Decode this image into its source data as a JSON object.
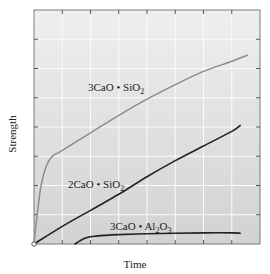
{
  "chart_data": {
    "type": "line",
    "title": "",
    "xlabel": "Time",
    "ylabel": "Strength",
    "x_ticks_labeled": false,
    "y_ticks_labeled": false,
    "grid": true,
    "grid_divisions": {
      "x": 8,
      "y": 8
    },
    "xlim": [
      0,
      8
    ],
    "ylim": [
      0,
      8
    ],
    "legend": "inline labels on curves",
    "series": [
      {
        "name": "3CaO • SiO2",
        "label_display": "3CaO • SiO₂",
        "color": "#8c8c8c",
        "points": [
          [
            0,
            0
          ],
          [
            0.1,
            0.9
          ],
          [
            0.25,
            2.0
          ],
          [
            0.45,
            2.7
          ],
          [
            0.65,
            3.0
          ],
          [
            1.0,
            3.2
          ],
          [
            2,
            3.8
          ],
          [
            3,
            4.4
          ],
          [
            4,
            4.95
          ],
          [
            5,
            5.45
          ],
          [
            6,
            5.9
          ],
          [
            7,
            6.25
          ],
          [
            7.55,
            6.45
          ]
        ]
      },
      {
        "name": "2CaO • SiO2",
        "label_display": "2CaO • SiO₂",
        "color": "#222222",
        "points": [
          [
            0,
            0
          ],
          [
            1,
            0.6
          ],
          [
            2,
            1.15
          ],
          [
            3,
            1.7
          ],
          [
            4,
            2.3
          ],
          [
            5,
            2.85
          ],
          [
            6,
            3.35
          ],
          [
            7,
            3.85
          ],
          [
            7.3,
            4.05
          ]
        ]
      },
      {
        "name": "3CaO • Al2O3",
        "label_display": "3CaO • Al₂O₃",
        "color": "#222222",
        "points": [
          [
            1.45,
            0
          ],
          [
            1.8,
            0.2
          ],
          [
            2.2,
            0.27
          ],
          [
            3,
            0.32
          ],
          [
            4,
            0.35
          ],
          [
            5,
            0.37
          ],
          [
            6,
            0.38
          ],
          [
            7,
            0.38
          ],
          [
            7.3,
            0.37
          ]
        ]
      }
    ]
  },
  "labels": {
    "c3s": "3CaO • SiO",
    "c3s_sub": "2",
    "c2s": "2CaO • SiO",
    "c2s_sub": "2",
    "c3a_a": "3CaO • Al",
    "c3a_sub1": "2",
    "c3a_b": "O",
    "c3a_sub2": "3",
    "xlabel": "Time",
    "ylabel": "Strength"
  },
  "colors": {
    "plot_bg": "#d9d9d9",
    "plot_bg_top": "#ececec",
    "grid": "#f5f5f5",
    "frame": "#777777"
  }
}
